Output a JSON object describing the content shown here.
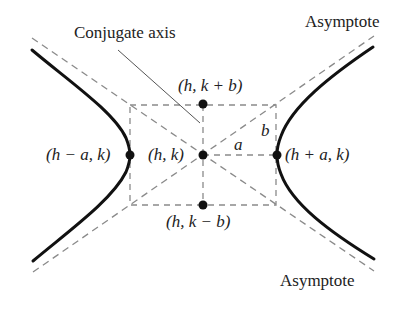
{
  "diagram": {
    "type": "hyperbola-horizontal-transverse-axis",
    "labels": {
      "conjugate_axis": "Conjugate axis",
      "asymptote_top": "Asymptote",
      "asymptote_bottom": "Asymptote",
      "top_vertex": "(h, k + b)",
      "bottom_vertex": "(h, k − b)",
      "left_vertex": "(h − a, k)",
      "right_vertex": "(h + a, k)",
      "center": "(h, k)",
      "a_segment": "a",
      "b_segment": "b"
    },
    "colors": {
      "curve": "#111111",
      "dashed": "#8a8a8a",
      "leader": "#555555",
      "point": "#111111",
      "text": "#222222"
    }
  }
}
